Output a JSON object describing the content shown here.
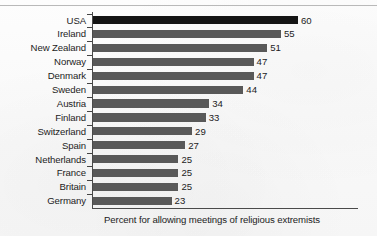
{
  "chart_data": {
    "type": "bar",
    "orientation": "horizontal",
    "title": "",
    "subtitle": "",
    "caption": "Percent for allowing meetings of religious extremists",
    "xlabel": "",
    "ylabel": "",
    "xlim": [
      0,
      60
    ],
    "grid": false,
    "legend": null,
    "highlight_category": "USA",
    "highlight_color": "#151515",
    "bar_color": "#595959",
    "categories": [
      "USA",
      "Ireland",
      "New Zealand",
      "Norway",
      "Denmark",
      "Sweden",
      "Austria",
      "Finland",
      "Switzerland",
      "Spain",
      "Netherlands",
      "France",
      "Britain",
      "Germany"
    ],
    "values": [
      60,
      55,
      51,
      47,
      47,
      44,
      34,
      33,
      29,
      27,
      25,
      25,
      25,
      23
    ],
    "value_labels": [
      "60",
      "55",
      "51",
      "47",
      "47",
      "44",
      "34",
      "33",
      "29",
      "27",
      "25",
      "25",
      "25",
      "23"
    ]
  }
}
